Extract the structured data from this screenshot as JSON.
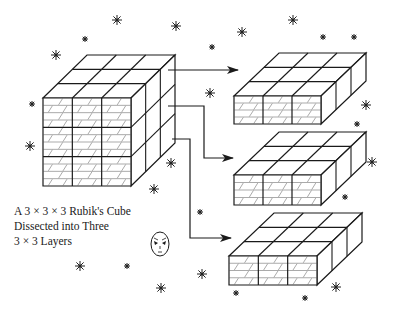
{
  "caption": {
    "line1": "A 3 × 3 × 3 Rubik's Cube",
    "line2": "Dissected into Three",
    "line3": "3 × 3 Layers"
  },
  "colors": {
    "line": "#1a1a1a",
    "hatch": "#555555",
    "background": "#ffffff"
  },
  "figure": {
    "main_cube": {
      "grid": "3x3x3",
      "front_face": "brick-pattern"
    },
    "layers": [
      {
        "label": "top-layer",
        "grid": "3x3x1"
      },
      {
        "label": "middle-layer",
        "grid": "3x3x1"
      },
      {
        "label": "bottom-layer",
        "grid": "3x3x1"
      }
    ],
    "arrows": 3,
    "decorations": [
      "stars",
      "alien-face"
    ]
  }
}
